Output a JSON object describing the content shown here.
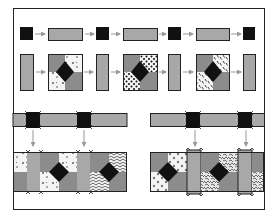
{
  "diagram": {
    "colors": {
      "background": "#ffffff",
      "frame": "#222222",
      "sashing_gray": "#a8a8a8",
      "block_gray": "#8c8c8c",
      "cornerstone_black": "#111111",
      "arrow": "#999999",
      "print_white": "#f4f4f4"
    },
    "steps": [
      {
        "id": "step-1",
        "label": "Join cornerstones and sashing strips into a row"
      },
      {
        "id": "step-2",
        "label": "Join vertical sashing strips and pieced blocks into a row"
      },
      {
        "id": "step-3",
        "label": "Join sashing rows to block rows"
      }
    ],
    "rows": {
      "cornerstone_row": [
        "cornerstone",
        "sashing",
        "cornerstone",
        "sashing",
        "cornerstone",
        "sashing",
        "cornerstone"
      ],
      "block_row": [
        "sashing",
        "block-print-a",
        "sashing",
        "block-print-dots",
        "sashing",
        "block-print-dashes",
        "sashing"
      ],
      "assembly_left_blocks": [
        "block-print-scatter",
        "block-print-herringbone"
      ],
      "assembly_right_blocks": [
        "block-print-circles",
        "block-print-mottled"
      ]
    }
  }
}
